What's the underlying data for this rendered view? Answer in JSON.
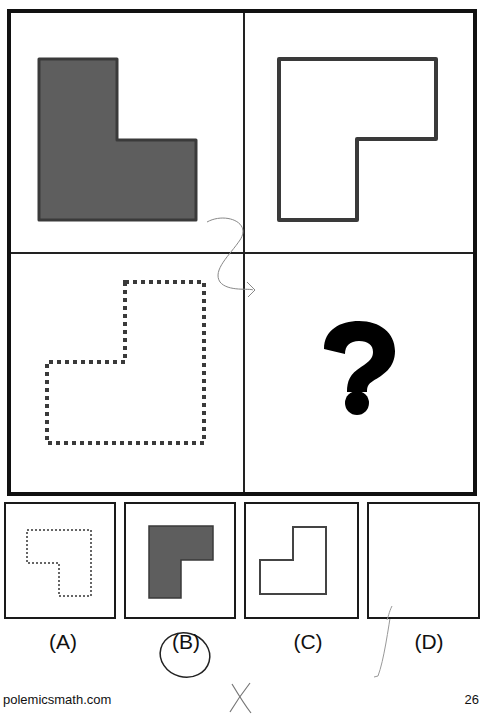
{
  "puzzle": {
    "grid": {
      "cells": [
        {
          "position": "top-left",
          "shape": "L-shape",
          "style": "filled",
          "fill": "#5e5e5e",
          "stroke": "#3a3a3a"
        },
        {
          "position": "top-right",
          "shape": "L-shape (rotated)",
          "style": "outline-solid",
          "stroke": "#3a3a3a"
        },
        {
          "position": "bottom-left",
          "shape": "L-shape (rotated)",
          "style": "outline-dotted",
          "stroke": "#3a3a3a"
        },
        {
          "position": "bottom-right",
          "shape": "question-mark",
          "symbol": "?"
        }
      ]
    },
    "options": [
      {
        "label": "(A)",
        "style": "outline-dotted"
      },
      {
        "label": "(B)",
        "style": "filled",
        "fill": "#5e5e5e"
      },
      {
        "label": "(C)",
        "style": "outline-solid"
      },
      {
        "label": "(D)",
        "style": "empty"
      }
    ],
    "annotations": {
      "circled_option": "(B)",
      "cross_mark": "X"
    }
  },
  "footer": {
    "site": "polemicsmath.com",
    "page_number": "26"
  }
}
